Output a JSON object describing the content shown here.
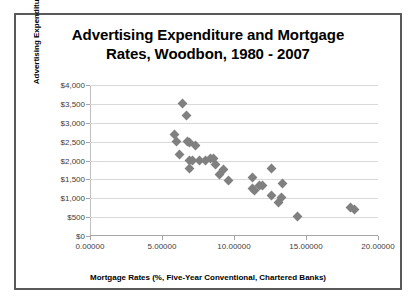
{
  "chart_data": {
    "type": "scatter",
    "title": "Advertising Expenditure and Mortgage Rates, Woodbon, 1980 - 2007",
    "title_line1": "Advertising Expenditure and Mortgage",
    "title_line2": "Rates, Woodbon, 1980 - 2007",
    "xlabel": "Mortgage Rates (%, Five-Year Conventional, Chartered Banks)",
    "ylabel": "Advertising Expenditure",
    "xlim": [
      0,
      20
    ],
    "ylim": [
      0,
      4000
    ],
    "xticks": [
      0,
      5,
      10,
      15,
      20
    ],
    "xtick_labels": [
      "0.00000",
      "5.00000",
      "10.00000",
      "15.00000",
      "20.00000"
    ],
    "yticks": [
      0,
      500,
      1000,
      1500,
      2000,
      2500,
      3000,
      3500,
      4000
    ],
    "ytick_labels": [
      "$0",
      "$500",
      "$1,000",
      "$1,500",
      "$2,000",
      "$2,500",
      "$3,000",
      "$3,500",
      "$4,000"
    ],
    "grid": "horizontal",
    "legend": "none",
    "marker": "diamond",
    "marker_color": "#808080",
    "series": [
      {
        "name": "Advertising Expenditure vs Mortgage Rate",
        "points": [
          {
            "x": 6.4,
            "y": 3500
          },
          {
            "x": 6.7,
            "y": 3200
          },
          {
            "x": 5.9,
            "y": 2700
          },
          {
            "x": 6.0,
            "y": 2500
          },
          {
            "x": 6.8,
            "y": 2500
          },
          {
            "x": 6.9,
            "y": 2480
          },
          {
            "x": 7.3,
            "y": 2400
          },
          {
            "x": 6.2,
            "y": 2150
          },
          {
            "x": 6.9,
            "y": 2000
          },
          {
            "x": 7.1,
            "y": 2000
          },
          {
            "x": 7.6,
            "y": 2000
          },
          {
            "x": 8.0,
            "y": 2000
          },
          {
            "x": 8.4,
            "y": 2050
          },
          {
            "x": 8.6,
            "y": 2050
          },
          {
            "x": 6.9,
            "y": 1800
          },
          {
            "x": 8.7,
            "y": 1900
          },
          {
            "x": 9.3,
            "y": 1750
          },
          {
            "x": 9.0,
            "y": 1640
          },
          {
            "x": 9.6,
            "y": 1480
          },
          {
            "x": 11.3,
            "y": 1550
          },
          {
            "x": 12.6,
            "y": 1800
          },
          {
            "x": 11.3,
            "y": 1250
          },
          {
            "x": 11.4,
            "y": 1200
          },
          {
            "x": 11.8,
            "y": 1330
          },
          {
            "x": 12.0,
            "y": 1350
          },
          {
            "x": 13.4,
            "y": 1400
          },
          {
            "x": 12.6,
            "y": 1060
          },
          {
            "x": 13.3,
            "y": 1030
          },
          {
            "x": 13.1,
            "y": 880
          },
          {
            "x": 14.4,
            "y": 520
          },
          {
            "x": 18.1,
            "y": 750
          },
          {
            "x": 18.4,
            "y": 700
          }
        ]
      }
    ]
  }
}
